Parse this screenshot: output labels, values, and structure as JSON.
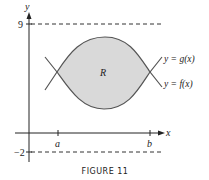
{
  "figure": {
    "caption": "FIGURE 11",
    "axes": {
      "x_label": "x",
      "y_label": "y",
      "y_ticks": [
        {
          "value": "9",
          "dashed_line": true
        },
        {
          "value": "−2",
          "dashed_line": true
        }
      ],
      "x_ticks": [
        {
          "label": "a"
        },
        {
          "label": "b"
        }
      ]
    },
    "curves": [
      {
        "label": "y = g(x)",
        "role": "upper"
      },
      {
        "label": "y = f(x)",
        "role": "lower"
      }
    ],
    "region": {
      "label": "R",
      "fill": "#d9d9d9"
    },
    "colors": {
      "axis": "#222222",
      "curve": "#555555",
      "dash": "#333333",
      "text": "#222222"
    }
  }
}
